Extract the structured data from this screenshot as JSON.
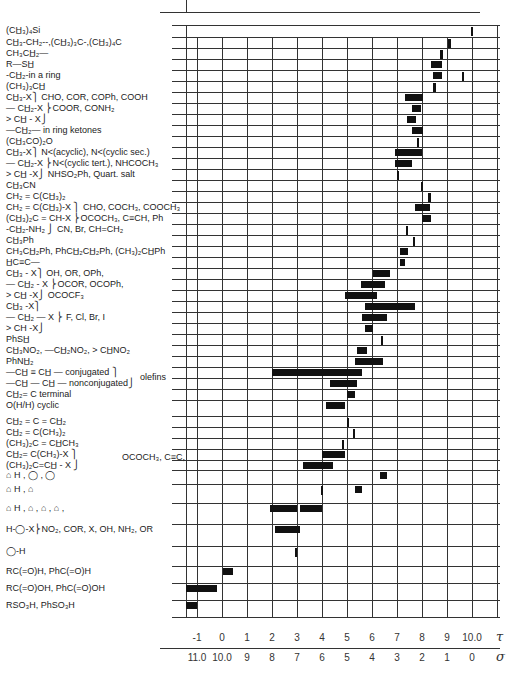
{
  "chart_data": {
    "type": "bar",
    "subtype": "range-bar (NMR chemical shift correlation chart)",
    "title": "",
    "xlabel_top": "τ",
    "xlabel_bottom": "σ",
    "xlim_tau": [
      -1.45,
      10.4
    ],
    "tau_ticks": [
      "-1",
      "0",
      "1",
      "2",
      "3",
      "4",
      "5",
      "6",
      "7",
      "8",
      "9",
      "10.0"
    ],
    "sigma_ticks": [
      "11.0",
      "10.0",
      "9",
      "8",
      "7",
      "6",
      "5",
      "4",
      "3",
      "2",
      "1",
      "0"
    ],
    "grid": true,
    "rows": [
      {
        "label": "(CH3)4Si",
        "ranges": [
          [
            9.95,
            10.05
          ]
        ]
      },
      {
        "label": "CH3-CH2--,(CH3)3C-,(CH3)4C",
        "ranges": [
          [
            9.05,
            9.15
          ]
        ]
      },
      {
        "label": "CH3CH2—",
        "ranges": [
          [
            8.72,
            8.82
          ]
        ]
      },
      {
        "label": "R—SH",
        "ranges": [
          [
            8.35,
            8.8
          ]
        ]
      },
      {
        "label": "-CH2-in a ring",
        "ranges": [
          [
            8.45,
            8.8
          ],
          [
            9.6,
            9.68
          ]
        ]
      },
      {
        "label": "(CH3)3CH",
        "ranges": [
          [
            8.45,
            8.55
          ]
        ]
      },
      {
        "label": "CH3-X } CHO, COR, COPh, COOH",
        "ranges": [
          [
            7.3,
            8.05
          ]
        ]
      },
      {
        "label": "— CH2-X } COOR, CONH2",
        "ranges": [
          [
            7.6,
            7.95
          ]
        ]
      },
      {
        "label": "> CH — X",
        "ranges": [
          [
            7.4,
            7.75
          ]
        ]
      },
      {
        "label": "—CH2— in ring ketones",
        "ranges": [
          [
            7.6,
            8.05
          ]
        ]
      },
      {
        "label": "(CH3CO)2O",
        "ranges": [
          [
            7.78,
            7.85
          ]
        ]
      },
      {
        "label": "CH3-X } N<(acyclic), N<(cyclic sec.)",
        "ranges": [
          [
            6.9,
            8.0
          ]
        ]
      },
      {
        "label": "— CH2-X } N<(cyclic tert.), NHCOCH3",
        "ranges": [
          [
            6.9,
            7.6
          ]
        ]
      },
      {
        "label": "> CH —X } NHSO2Ph, Quart. salt",
        "ranges": [
          [
            6.98,
            7.05
          ]
        ]
      },
      {
        "label": "CH3CN",
        "ranges": [
          [
            7.95,
            8.02
          ]
        ]
      },
      {
        "label": "CH2 = C(CH3)2",
        "ranges": [
          [
            8.25,
            8.35
          ]
        ]
      },
      {
        "label": "CH2 = C(CH3)-X } CHO, COCH3, COOCH3",
        "ranges": [
          [
            7.7,
            8.3
          ]
        ]
      },
      {
        "label": "(CH3)2C = CH-X } OCOCH3, C≡CH, Ph",
        "ranges": [
          [
            8.0,
            8.35
          ]
        ]
      },
      {
        "label": "-CH2-NH2 } CN, Br, CH=CH2",
        "ranges": [
          [
            7.35,
            7.45
          ]
        ]
      },
      {
        "label": "CH3Ph",
        "ranges": [
          [
            7.65,
            7.72
          ]
        ]
      },
      {
        "label": "CH3CH2Ph, PhCH2CH2Ph, (CH3)2CHPh",
        "ranges": [
          [
            7.1,
            7.45
          ]
        ]
      },
      {
        "label": "HC≡C—",
        "ranges": [
          [
            7.1,
            7.3
          ]
        ]
      },
      {
        "label": "CH3-X } OH, OR, OPh,",
        "ranges": [
          [
            6.05,
            6.7
          ]
        ]
      },
      {
        "label": "— CH2-X } OCOR, OCOPh,",
        "ranges": [
          [
            5.55,
            6.5
          ]
        ]
      },
      {
        "label": "> CH -X } OCOCF3",
        "ranges": [
          [
            4.9,
            6.2
          ]
        ]
      },
      {
        "label": "CH3 -X",
        "ranges": [
          [
            5.7,
            7.7
          ]
        ]
      },
      {
        "label": "— CH2 — X } F, Cl, Br, I",
        "ranges": [
          [
            5.6,
            6.6
          ]
        ]
      },
      {
        "label": "> CH -X",
        "ranges": [
          [
            5.7,
            6.05
          ]
        ]
      },
      {
        "label": "PhSH",
        "ranges": [
          [
            6.35,
            6.42
          ]
        ]
      },
      {
        "label": "CH3NO2, —CH2NO2, > CHNO2",
        "ranges": [
          [
            5.4,
            5.8
          ]
        ]
      },
      {
        "label": "PhNH2",
        "ranges": [
          [
            5.3,
            6.45
          ]
        ]
      },
      {
        "label": "—CH ≡ CH — conjugated } olefins",
        "ranges": [
          [
            2.0,
            5.6
          ]
        ]
      },
      {
        "label": "—CH — CH — nonconjugated",
        "ranges": [
          [
            4.3,
            5.4
          ]
        ]
      },
      {
        "label": "CH2 = C terminal",
        "ranges": [
          [
            5.0,
            5.3
          ]
        ]
      },
      {
        "label": "O(H/H) cyclic",
        "ranges": [
          [
            4.15,
            4.9
          ]
        ]
      },
      {
        "label": "CH2 = C = CH2",
        "ranges": [
          [
            5.0,
            5.08
          ]
        ]
      },
      {
        "label": "CH2 = C(CH3)2",
        "ranges": [
          [
            5.25,
            5.32
          ]
        ]
      },
      {
        "label": "(CH3)2C = CHCH3",
        "ranges": [
          [
            4.8,
            4.87
          ]
        ]
      },
      {
        "label": "CH2 = C(CH3) - X } OCOCH3, C≡C,",
        "ranges": [
          [
            4.0,
            4.9
          ]
        ]
      },
      {
        "label": "(CH3)2C = CH - X",
        "ranges": [
          [
            3.25,
            4.45
          ]
        ]
      },
      {
        "label": "furan-H, dioxin, dioxane",
        "ranges": [
          [
            6.3,
            6.6
          ]
        ]
      },
      {
        "label": "dihydrofuran-H, furan",
        "ranges": [
          [
            3.95,
            4.0
          ],
          [
            5.3,
            5.6
          ]
        ]
      },
      {
        "label": "furan-H, thiophene, pyrrole, pyridine",
        "ranges": [
          [
            1.9,
            3.0
          ],
          [
            3.1,
            4.0
          ]
        ]
      },
      {
        "label": "H-C6H4-X } NO2, COR, X, OH, NH2, OR",
        "ranges": [
          [
            2.1,
            3.1
          ]
        ]
      },
      {
        "label": "benzene-H",
        "ranges": [
          [
            2.92,
            2.98
          ]
        ]
      },
      {
        "label": "RC(=O)H, PhC(=O)H",
        "ranges": [
          [
            0.05,
            0.45
          ]
        ]
      },
      {
        "label": "RC(=O)OH, PhC(=O)OH",
        "ranges": [
          [
            -1.45,
            -0.2
          ]
        ]
      },
      {
        "label": "RSO3H, PhSO3H",
        "ranges": [
          [
            -1.45,
            -1.0
          ]
        ]
      }
    ]
  },
  "labels": {
    "r1": "(CH̲₃)₄Si",
    "r2": "CH̲₃-CH₂--,(CH̲₃)₃C-,(CH̲₃)₄C",
    "r3": "CH₃CH̲₂—",
    "r4": "R—SH̲",
    "r5": "-CH̲₂-in a ring",
    "r6": "(CH₃)₃CH̲",
    "r7": "   CH̲₃-X⎫ CHO, COR, COPh, COOH",
    "r8": "— CH̲₂-X ⎬COOR, CONH₂",
    "r9": "> CH̲ - X⎭",
    "r10": "—CH̲₂— in ring ketones",
    "r11": "(CH̲₃CO)₂O",
    "r12": "   CH̲₃-X⎫ N<(acyclic), N<(cyclic sec.)",
    "r13": "— CH̲₂-X ⎬N<(cyclic tert.), NHCOCH₃",
    "r14": "> CH̲ -X⎭ NHSO₂Ph, Quart. salt",
    "r15": "CH̲₃CN",
    "r16": "CH₂ = C(CH̲₃)₂",
    "r17": "CH₂ = C(CH̲₃)-X  ⎫ CHO, COCH₃, COOCH₃",
    "r18": "(CH̲₃)₂C = CH-X ⎬OCOCH₃, C≡CH, Ph",
    "r19": "-CH̲₂-NH₂          ⎭ CN, Br, CH=CH₂",
    "r20": "CH̲₃Ph",
    "r21": "CH₃CH̲₂Ph, PhCH̲₂CH̲₂Ph, (CH₃)₂CH̲Ph",
    "r22": "H̲C≡C—",
    "r23": "   CH̲₃ - X⎫ OH, OR, OPh,",
    "r24": "— CH̲₂ - X ⎬OCOR, OCOPh,",
    "r25": "> CH̲  -X⎭ OCOCF₃",
    "r26": "   CH̲₃ -X⎫",
    "r27": "— CH̲₂ — X ⎬ F, Cl, Br, I",
    "r28": "> CH  -X⎭",
    "r29": "PhSH̲",
    "r30": "CH̲₃NO₂, —CH̲₂NO₂, > CH̲NO₂",
    "r31": "PhNH̲₂",
    "r32": "—CH̲ ≡ CH̲ — conjugated ⎫",
    "r32b": "olefins",
    "r33": "—CH̲ — CH̲ — nonconjugated⎭",
    "r34": "CH̲₂= C terminal",
    "r35": "O(H/H) cyclic",
    "r36": "CH̲₂ = C = CH̲₂",
    "r37": "CH̲₂ = C(CH₃)₂",
    "r38": "(CH₃)₂C = CH̲CH₃",
    "r39": "CH̲₂= C(CH₃)-X ⎫",
    "r39b": "OCOCH₃, C≡C,",
    "r40": "(CH₃)₂C=CH̲ - X ⎭",
    "r41": "⌂ H , ◯ , ◯",
    "r42": "⌂ H , ⌂",
    "r43": "⌂ H , ⌂ , ⌂ , ⌂ ,",
    "r44": "H-◯-X⎬NO₂, COR, X, OH, NH₂, OR",
    "r45": "◯-H",
    "r46": "RC(=O)H, PhC(=O)H",
    "r47": "RC(=O)OH, PhC(=O)OH",
    "r48": "RSO₃H, PhSO₃H"
  },
  "axis": {
    "tau_symbol": "τ",
    "sigma_symbol": "σ"
  }
}
